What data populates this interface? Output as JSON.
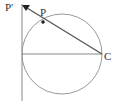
{
  "diagram": {
    "labels": {
      "p_prime": "P′",
      "p": "P",
      "c": "C"
    },
    "colors": {
      "stroke": "#888888",
      "line_dark": "#444444",
      "text": "#333333"
    },
    "circle": {
      "cx": 62,
      "cy": 54,
      "r": 40
    },
    "points": {
      "p": {
        "x": 43,
        "y": 22
      },
      "c": {
        "x": 102,
        "y": 54
      },
      "p_prime": {
        "x": 26,
        "y": 6
      }
    }
  }
}
